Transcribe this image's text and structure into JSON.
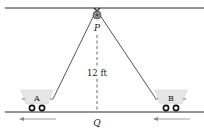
{
  "diagram": {
    "type": "pulley-carts",
    "labels": {
      "pulley": "P",
      "ground_point": "Q",
      "cart_a": "A",
      "cart_b": "B",
      "height": "12 ft"
    },
    "colors": {
      "line": "#2a2a2a",
      "rope": "#555555",
      "cart_fill": "#e6e6e6",
      "pulley_fill": "#8a8a8a",
      "arrow": "#888888"
    },
    "motion": {
      "cart_a_direction": "left",
      "cart_b_direction": "left"
    }
  }
}
